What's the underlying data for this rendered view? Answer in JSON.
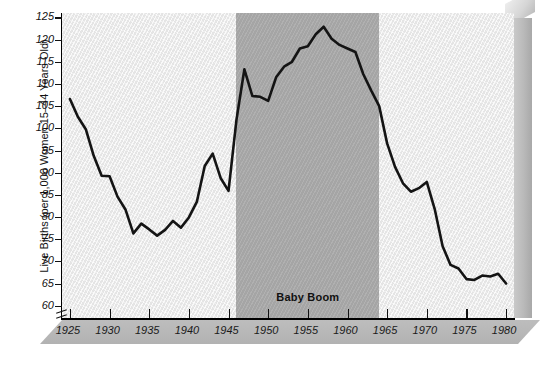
{
  "chart_data": {
    "type": "line",
    "title": "",
    "xlabel": "",
    "ylabel": "Live Births (per 1,000 Women 15–44 Years Old)",
    "xlim": [
      1924,
      1981
    ],
    "ylim": [
      57,
      126
    ],
    "ytick_labels": [
      "125",
      "120",
      "115",
      "110",
      "105",
      "100",
      "95",
      "90",
      "85",
      "80",
      "75",
      "70",
      "65",
      "60"
    ],
    "ytick_values": [
      125,
      120,
      115,
      110,
      105,
      100,
      95,
      90,
      85,
      80,
      75,
      70,
      65,
      60
    ],
    "xtick_labels": [
      "1925",
      "1930",
      "1935",
      "1940",
      "1945",
      "1950",
      "1955",
      "1960",
      "1965",
      "1970",
      "1975",
      "1980"
    ],
    "xtick_values": [
      1925,
      1930,
      1935,
      1940,
      1945,
      1950,
      1955,
      1960,
      1965,
      1970,
      1975,
      1980
    ],
    "grid": false,
    "legend": "none",
    "axis_break": true,
    "annotations": [
      {
        "label": "Baby Boom",
        "type": "shaded-span",
        "x_start": 1946,
        "x_end": 1964
      }
    ],
    "line_color": "#141414",
    "plot_background": "#eeeeee",
    "band_color": "#a8a8a8",
    "x": [
      1925,
      1926,
      1927,
      1928,
      1929,
      1930,
      1931,
      1932,
      1933,
      1934,
      1935,
      1936,
      1937,
      1938,
      1939,
      1940,
      1941,
      1942,
      1943,
      1944,
      1945,
      1946,
      1947,
      1948,
      1949,
      1950,
      1951,
      1952,
      1953,
      1954,
      1955,
      1956,
      1957,
      1958,
      1959,
      1960,
      1961,
      1962,
      1963,
      1964,
      1965,
      1966,
      1967,
      1968,
      1969,
      1970,
      1971,
      1972,
      1973,
      1974,
      1975,
      1976,
      1977,
      1978,
      1979,
      1980
    ],
    "y": [
      106.6,
      102.6,
      99.8,
      93.8,
      89.3,
      89.2,
      84.6,
      81.7,
      76.3,
      78.5,
      77.2,
      75.8,
      77.1,
      79.1,
      77.6,
      79.9,
      83.4,
      91.5,
      94.3,
      88.8,
      85.9,
      101.9,
      113.3,
      107.3,
      107.1,
      106.2,
      111.5,
      113.9,
      115.0,
      118.0,
      118.5,
      121.2,
      122.9,
      120.2,
      118.8,
      118.0,
      117.2,
      112.2,
      108.5,
      105.0,
      96.6,
      91.3,
      87.6,
      85.7,
      86.5,
      87.9,
      81.8,
      73.4,
      69.2,
      68.4,
      66.0,
      65.8,
      66.8,
      66.6,
      67.2,
      65.0
    ]
  },
  "accessibility": {
    "figure_role": "line-chart"
  }
}
